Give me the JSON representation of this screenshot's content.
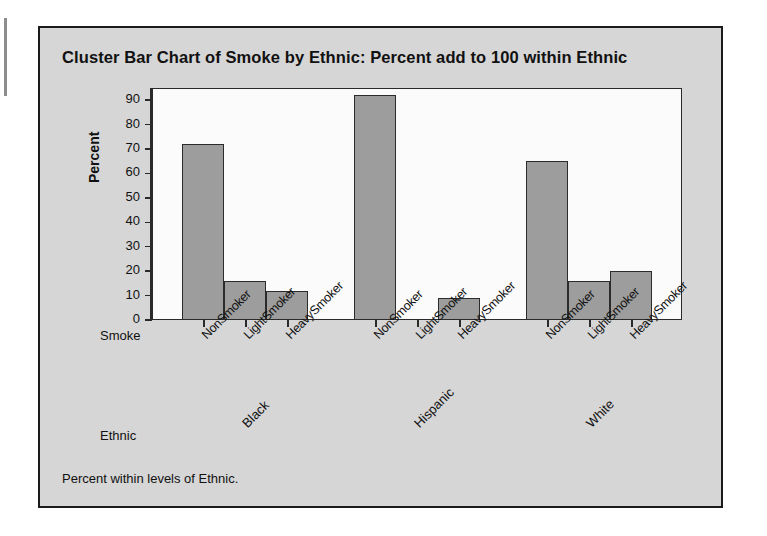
{
  "chart_data": {
    "type": "bar",
    "title": "Cluster Bar Chart of Smoke by Ethnic: Percent add to 100 within Ethnic",
    "xlabel": "Smoke",
    "group_axis_label": "Ethnic",
    "ylabel": "Percent",
    "ylim": [
      0,
      95
    ],
    "yticks": [
      0,
      10,
      20,
      30,
      40,
      50,
      60,
      70,
      80,
      90
    ],
    "grid": false,
    "legend": "none",
    "categories": [
      "NonSmoker",
      "LightSmoker",
      "HeavySmoker"
    ],
    "groups": [
      "Black",
      "Hispanic",
      "White"
    ],
    "series": [
      {
        "name": "Black",
        "values": [
          72,
          16,
          12
        ]
      },
      {
        "name": "Hispanic",
        "values": [
          92,
          0,
          9
        ]
      },
      {
        "name": "White",
        "values": [
          65,
          16,
          20
        ]
      }
    ],
    "bar_fill_color": "#9d9d9d",
    "bar_border_color": "#2b2b2b",
    "plot_background": "#fbfbfb",
    "panel_background": "#d6d6d6",
    "footnote": "Percent within levels of Ethnic."
  },
  "panel": {
    "title": "Cluster Bar Chart of Smoke by Ethnic: Percent add to 100 within Ethnic",
    "footnote": "Percent within levels of Ethnic.",
    "y_axis_title": "Percent",
    "x_axis_name": "Smoke",
    "group_axis_name": "Ethnic"
  }
}
